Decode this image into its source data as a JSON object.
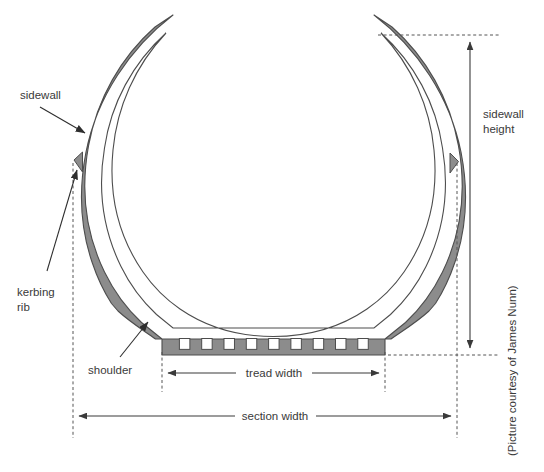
{
  "figure": {
    "credit": "(Picture courtesy of James Nunn)",
    "colors": {
      "rubber_fill": "#8c8c8c",
      "rubber_stroke": "#4d4d4d",
      "line": "#3a3a3a",
      "dashed": "#555555",
      "background": "#ffffff",
      "text": "#3a3a3a"
    }
  },
  "labels": {
    "sidewall": "sidewall",
    "kerbing_rib_line1": "kerbing",
    "kerbing_rib_line2": "rib",
    "shoulder": "shoulder",
    "sidewall_height_line1": "sidewall",
    "sidewall_height_line2": "height",
    "tread_width": "tread width",
    "section_width": "section width"
  },
  "dimensions": {
    "sidewall_height": {
      "name": "sidewall height",
      "orientation": "vertical",
      "top_y": 35,
      "bottom_y": 355,
      "axis_x": 470
    },
    "tread_width": {
      "name": "tread width",
      "orientation": "horizontal",
      "left_x": 162,
      "right_x": 385,
      "axis_y": 373
    },
    "section_width": {
      "name": "section width",
      "orientation": "horizontal",
      "left_x": 73,
      "right_x": 457,
      "axis_y": 416
    }
  },
  "tread": {
    "groove_count": 9,
    "groove_start_x": 162,
    "groove_end_x": 385,
    "tread_top_y": 339,
    "tread_bottom_y": 355
  }
}
